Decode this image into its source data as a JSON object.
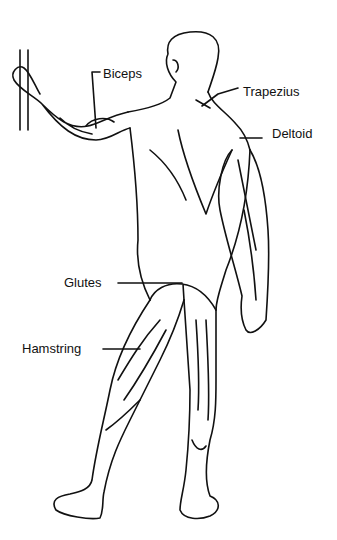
{
  "diagram": {
    "labels": [
      {
        "id": "biceps",
        "text": "Biceps",
        "x": 103,
        "y": 67
      },
      {
        "id": "trapezius",
        "text": "Trapezius",
        "x": 243,
        "y": 85
      },
      {
        "id": "deltoid",
        "text": "Deltoid",
        "x": 272,
        "y": 127
      },
      {
        "id": "glutes",
        "text": "Glutes",
        "x": 64,
        "y": 276
      },
      {
        "id": "hamstring",
        "text": "Hamstring",
        "x": 22,
        "y": 342
      }
    ],
    "colors": {
      "line": "#111111",
      "background": "#ffffff"
    }
  }
}
